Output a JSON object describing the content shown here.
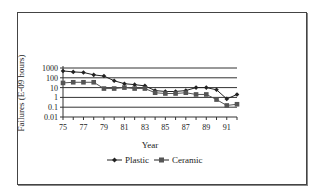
{
  "chart_data": {
    "type": "line",
    "title": "",
    "xlabel": "Year",
    "ylabel": "Failures (E-09 hours)",
    "yscale": "log",
    "ylim": [
      0.01,
      1000
    ],
    "y_ticks": [
      "1000",
      "100",
      "10",
      "1",
      "0.1",
      "0.01"
    ],
    "x_tick_labels": [
      "75",
      "77",
      "79",
      "81",
      "83",
      "85",
      "87",
      "89",
      "91"
    ],
    "x": [
      75,
      76,
      77,
      78,
      79,
      80,
      81,
      82,
      83,
      84,
      85,
      86,
      87,
      88,
      89,
      90,
      91,
      92
    ],
    "series": [
      {
        "name": "Plastic",
        "marker": "diamond",
        "values": [
          500,
          400,
          350,
          200,
          150,
          50,
          25,
          20,
          15,
          5,
          4,
          4,
          5,
          10,
          10,
          6,
          0.7,
          2
        ]
      },
      {
        "name": "Ceramic",
        "marker": "square",
        "values": [
          30,
          35,
          35,
          35,
          8,
          8,
          10,
          8,
          8,
          3,
          2.5,
          2.5,
          3,
          2,
          2,
          0.6,
          0.15,
          0.2
        ]
      }
    ],
    "grid": "horizontal major",
    "legend_position": "bottom"
  },
  "legend": {
    "items": [
      "Plastic",
      "Ceramic"
    ]
  }
}
